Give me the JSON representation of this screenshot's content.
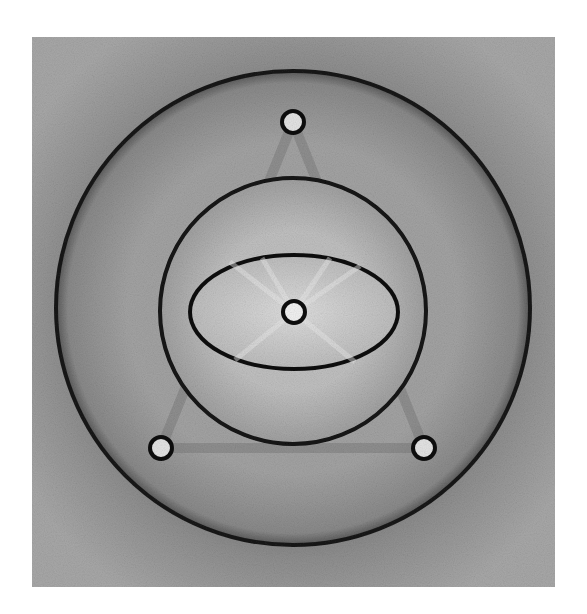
{
  "figure": {
    "background": "#ffffff",
    "field": {
      "x": 32,
      "y": 37,
      "width": 523,
      "height": 550,
      "color": "#8e8e8e"
    },
    "outer_disk": {
      "cx": 293,
      "cy": 308,
      "r": 237,
      "fill": "#9a9a9a",
      "stroke": "#1a1a1a"
    },
    "inner_disk": {
      "cx": 293,
      "cy": 311,
      "r": 133,
      "fill": "#b4b4b4",
      "stroke": "#141414"
    },
    "ellipse": {
      "cx": 294,
      "cy": 312,
      "rx": 104,
      "ry": 57,
      "fill": "#cdcdcd",
      "stroke": "#111111"
    },
    "holes": [
      {
        "name": "top-hole",
        "cx": 293,
        "cy": 122,
        "r": 11
      },
      {
        "name": "bottom-left-hole",
        "cx": 161,
        "cy": 448,
        "r": 11
      },
      {
        "name": "bottom-right-hole",
        "cx": 424,
        "cy": 448,
        "r": 11
      },
      {
        "name": "center-hole",
        "cx": 294,
        "cy": 312,
        "r": 11
      }
    ],
    "hole_fill": "#e4e4e4",
    "hole_stroke": "#0e0e0e"
  }
}
